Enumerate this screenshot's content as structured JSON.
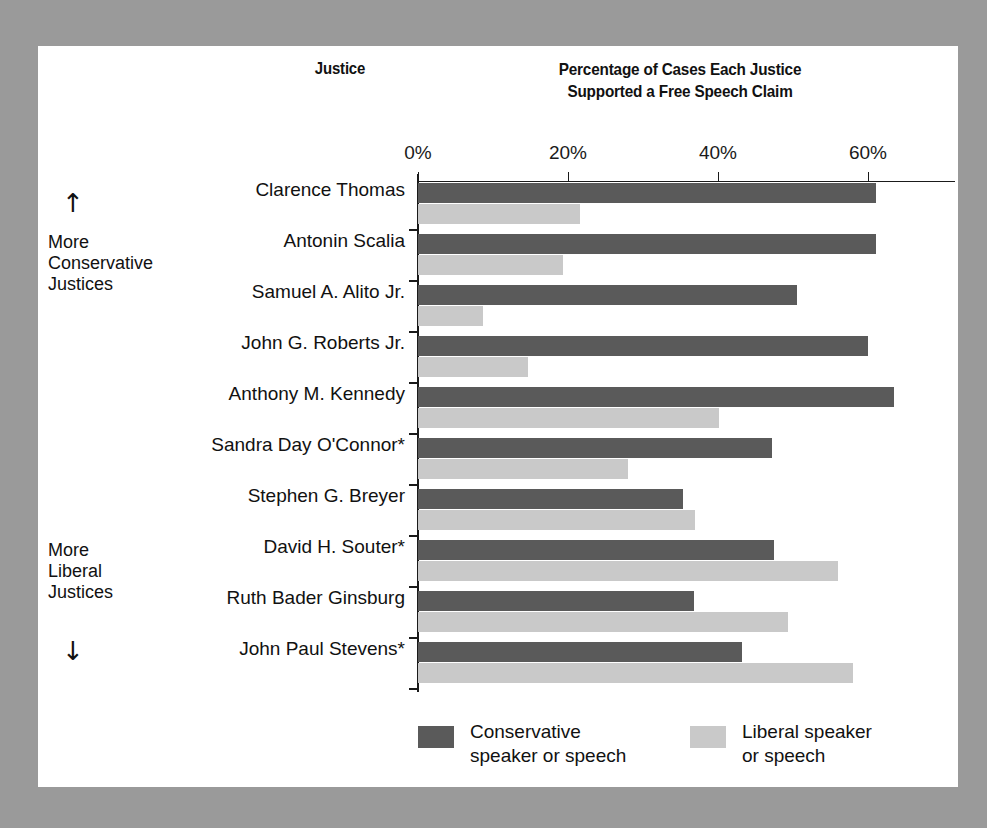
{
  "headers": {
    "justice_col": "Justice",
    "chart_title_line1": "Percentage of Cases Each Justice",
    "chart_title_line2": "Supported a Free Speech Claim"
  },
  "side_notes": {
    "up_arrow": "↑",
    "down_arrow": "↓",
    "conservative_l1": "More",
    "conservative_l2": "Conservative",
    "conservative_l3": "Justices",
    "liberal_l1": "More",
    "liberal_l2": "Liberal",
    "liberal_l3": "Justices"
  },
  "legend": {
    "conservative_l1": "Conservative",
    "conservative_l2": "speaker or speech",
    "liberal_l1": "Liberal speaker",
    "liberal_l2": "or speech",
    "conservative_color": "#5a5a5a",
    "liberal_color": "#c9c9c9"
  },
  "chart_data": {
    "type": "bar",
    "title": "Percentage of Cases Each Justice Supported a Free Speech Claim",
    "xlabel": "",
    "ylabel": "Justice",
    "orientation": "horizontal",
    "xlim": [
      0,
      71.5
    ],
    "grid": false,
    "legend_position": "bottom",
    "tick_labels": [
      "0%",
      "20%",
      "40%",
      "60%"
    ],
    "tick_values": [
      0,
      20,
      40,
      60
    ],
    "categories": [
      "Clarence Thomas",
      "Antonin Scalia",
      "Samuel A. Alito Jr.",
      "John G. Roberts Jr.",
      "Anthony M. Kennedy",
      "Sandra Day O'Connor*",
      "Stephen G. Breyer",
      "David H. Souter*",
      "Ruth Bader Ginsburg",
      "John Paul Stevens*"
    ],
    "series": [
      {
        "name": "Conservative speaker or speech",
        "color": "#5a5a5a",
        "values": [
          61.0,
          61.0,
          50.5,
          60.0,
          63.5,
          47.2,
          35.3,
          47.5,
          36.8,
          43.2
        ]
      },
      {
        "name": "Liberal speaker or speech",
        "color": "#c9c9c9",
        "values": [
          21.6,
          19.3,
          8.7,
          14.7,
          40.1,
          28.0,
          36.9,
          56.0,
          49.3,
          58.0
        ]
      }
    ],
    "footnote_marker": "*"
  }
}
